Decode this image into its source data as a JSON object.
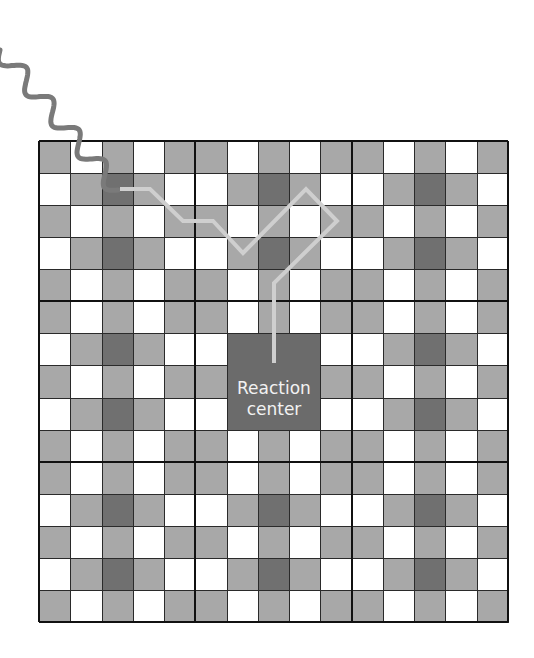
{
  "diagram": {
    "type": "antenna-complex-energy-transfer",
    "grid": {
      "rows": 15,
      "cols": 15,
      "block_size": 5,
      "block_pattern": [
        [
          "g",
          "w",
          "g",
          "w",
          "g"
        ],
        [
          "w",
          "g",
          "d",
          "g",
          "w"
        ],
        [
          "g",
          "w",
          "g",
          "w",
          "g"
        ],
        [
          "w",
          "g",
          "d",
          "g",
          "w"
        ],
        [
          "g",
          "w",
          "g",
          "w",
          "g"
        ]
      ]
    },
    "reaction_center": {
      "label_line1": "Reaction",
      "label_line2": "center",
      "row_start": 6,
      "col_start": 6,
      "span": 3
    },
    "energy_path_points": [
      [
        120,
        189
      ],
      [
        150,
        189
      ],
      [
        183,
        221
      ],
      [
        213,
        221
      ],
      [
        243,
        253
      ],
      [
        306,
        189
      ],
      [
        337,
        221
      ],
      [
        274,
        283
      ],
      [
        274,
        363
      ]
    ],
    "photon_wave": {
      "start": [
        0,
        50
      ],
      "end": [
        118,
        190
      ]
    },
    "colors": {
      "white_cell": "#ffffff",
      "gray_cell": "#a8a8a8",
      "dark_cell": "#707070",
      "reaction_center": "#6b6b6b",
      "grid_line": "#2a2a2a",
      "block_line": "#111111",
      "energy_path": "#cfcfcf",
      "photon": "#7a7a7a",
      "label_text": "#f2f2f2"
    }
  }
}
